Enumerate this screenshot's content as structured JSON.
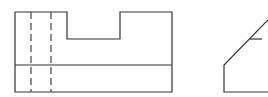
{
  "drawing": {
    "type": "orthographic-projection",
    "views": [
      {
        "name": "front-view",
        "outline": [
          [
            15,
            12
          ],
          [
            67,
            12
          ],
          [
            67,
            39
          ],
          [
            120,
            39
          ],
          [
            120,
            12
          ],
          [
            172,
            12
          ],
          [
            172,
            92
          ],
          [
            15,
            92
          ],
          [
            15,
            12
          ]
        ],
        "horizontal_line": {
          "y": 65,
          "x1": 15,
          "x2": 172
        },
        "hidden_lines_x": [
          31,
          51
        ],
        "hidden_line_span": [
          12,
          92
        ]
      },
      {
        "name": "side-view",
        "polyline": [
          [
            268,
            20
          ],
          [
            224,
            65
          ],
          [
            224,
            92
          ],
          [
            268,
            92
          ]
        ],
        "tick": {
          "y": 39,
          "x1": 250,
          "x2": 262
        }
      }
    ],
    "colors": {
      "line": "#333333",
      "background": "#ffffff"
    }
  }
}
